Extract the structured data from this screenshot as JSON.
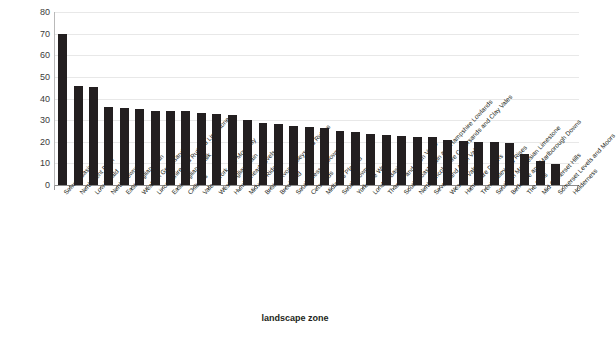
{
  "chart_data": {
    "type": "bar",
    "title": "",
    "xlabel": "landscape zone",
    "ylabel": "% of burial records",
    "ylim": [
      0,
      80
    ],
    "yticks": [
      0,
      10,
      20,
      30,
      40,
      50,
      60,
      70,
      80
    ],
    "grid": true,
    "legend": false,
    "bar_color": "#231f20",
    "categories": [
      "Solway Basin",
      "North Kent Plain",
      "Low Weald",
      "North Downs",
      "East Anglian Plain",
      "Wealden Greensand",
      "Lincolnshire and Rutland Limestone",
      "East Anglian Chalk",
      "Chilterns",
      "Vale of York and Mowbray",
      "West Anglian Plain",
      "Humberhead Levels",
      "Midvale Ridge",
      "Bristol, Avon Valleys and Ridges",
      "Breckland",
      "South Wessex Downs",
      "Cotswolds",
      "Midlands Plateau",
      "South Downs",
      "Yorkshire Wolds",
      "London Basin",
      "Thames and Avon Vales",
      "South Coast Plain and Hampshire Lowlands",
      "North Lincolnshire Coversands and Clay Vales",
      "Severn and Avon Vales",
      "Wessex Vales",
      "Hampshire Downs",
      "Trent Valley and Rises",
      "Southern Magnesian Limestone",
      "Berkshire and Marlborough Downs",
      "The Fens",
      "Mid Somerset Hills",
      "Somerset Levels and Moors",
      "Holderness"
    ],
    "values": [
      70,
      46,
      45.5,
      36,
      35.5,
      35,
      34,
      34,
      34,
      33.5,
      33,
      32.5,
      30,
      28.5,
      28,
      27.5,
      27,
      26.5,
      25,
      24.5,
      23.5,
      23,
      22.5,
      22,
      22,
      21,
      20.5,
      20,
      20,
      19.5,
      14.5,
      11,
      9.5,
      0
    ]
  }
}
